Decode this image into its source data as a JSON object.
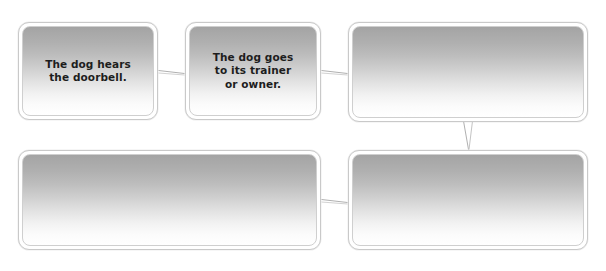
{
  "diagram": {
    "type": "flowchart",
    "background_color": "#ffffff",
    "box_border_color": "#c9c9c9",
    "box_gradient_top": "#a3a3a3",
    "box_gradient_bottom": "#ffffff",
    "text_color": "#1d1d1d",
    "connector_color": "#b4b4b4",
    "boxes": [
      {
        "id": "box-1",
        "label": "step-1",
        "text": "The dog hears\nthe doorbell.",
        "empty": false,
        "x": 18,
        "y": 22,
        "width": 140,
        "height": 98
      },
      {
        "id": "box-2",
        "label": "step-2",
        "text": "The dog goes\nto its trainer\nor owner.",
        "empty": false,
        "x": 185,
        "y": 22,
        "width": 136,
        "height": 98
      },
      {
        "id": "box-3",
        "label": "step-3",
        "text": "",
        "empty": true,
        "x": 348,
        "y": 22,
        "width": 240,
        "height": 100
      },
      {
        "id": "box-4",
        "label": "step-5",
        "text": "",
        "empty": true,
        "x": 18,
        "y": 150,
        "width": 303,
        "height": 100
      },
      {
        "id": "box-5",
        "label": "step-4",
        "text": "",
        "empty": true,
        "x": 348,
        "y": 150,
        "width": 240,
        "height": 100
      }
    ],
    "connectors": [
      {
        "id": "connector-1-2",
        "from": "box-1",
        "to": "box-2",
        "orientation": "horizontal"
      },
      {
        "id": "connector-2-3",
        "from": "box-2",
        "to": "box-3",
        "orientation": "horizontal"
      },
      {
        "id": "connector-3-5",
        "from": "box-3",
        "to": "box-5",
        "orientation": "vertical"
      },
      {
        "id": "connector-5-4",
        "from": "box-5",
        "to": "box-4",
        "orientation": "horizontal"
      }
    ]
  }
}
